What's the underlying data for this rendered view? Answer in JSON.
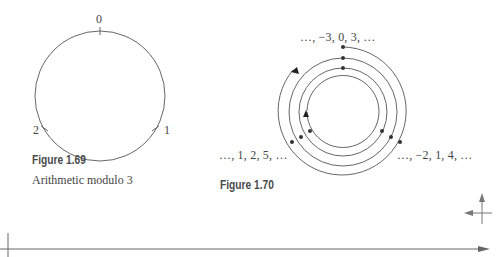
{
  "figure_169": {
    "title": "Figure 1.69",
    "caption": "Arithmetic modulo 3",
    "labels": {
      "top": "0",
      "right": "1",
      "left": "2"
    }
  },
  "figure_170": {
    "title": "Figure 1.70",
    "labels": {
      "top": "…, −3, 0, 3, …",
      "left": "…, 1, 2, 5, …",
      "right": "…, −2, 1, 4, …"
    }
  },
  "colors": {
    "line": "#555555",
    "text": "#444444",
    "title": "#4a4a4a"
  }
}
